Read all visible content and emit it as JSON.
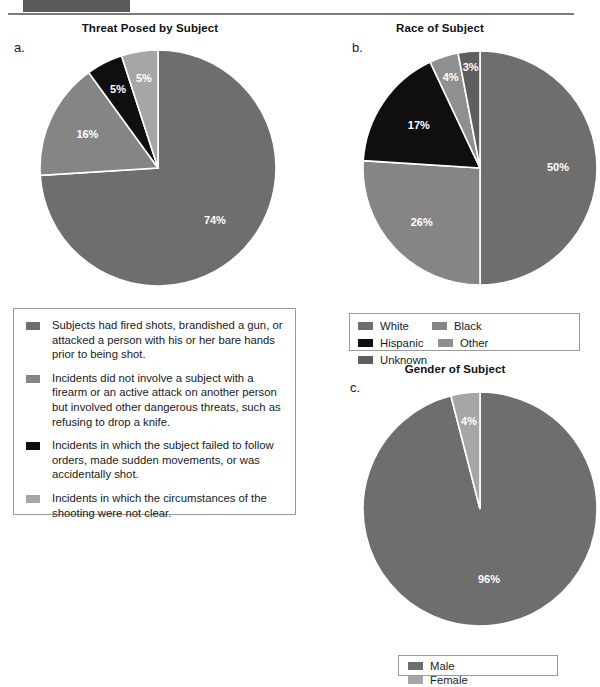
{
  "page": {
    "header_bar_color": "#595959",
    "header_rule_color": "#7a7a7a"
  },
  "palette": {
    "dark_gray": "#6e6e6e",
    "medium_gray": "#858585",
    "light_gray": "#a6a6a6",
    "black": "#0f0f0f",
    "mid_dark_gray": "#5e5e5e",
    "slice_divider": "#ffffff",
    "label_text": "#ffffff",
    "legend_border": "#9a9a9a"
  },
  "charts": [
    {
      "letter": "a.",
      "title": "Threat Posed by Subject",
      "chart_data": {
        "type": "pie",
        "title": "Threat Posed by Subject",
        "categories": [
          "Subjects had fired shots, brandished a gun, or attacked a person with his or her bare hands prior to being shot.",
          "Incidents did not involve a subject with a firearm or an active attack on another person but involved other dangerous threats, such as refusing to drop a knife.",
          "Incidents in which the subject failed to follow orders, made sudden movements, or was accidentally shot.",
          "Incidents in which the circumstances of the shooting were not clear."
        ],
        "values": [
          74,
          16,
          5,
          5
        ],
        "labels": [
          "74%",
          "16%",
          "5%",
          "5%"
        ],
        "colors": [
          "#6e6e6e",
          "#858585",
          "#0f0f0f",
          "#a6a6a6"
        ],
        "start_angle": 0,
        "direction": "clockwise",
        "legend_position": "below"
      }
    },
    {
      "letter": "b.",
      "title": "Race of Subject",
      "chart_data": {
        "type": "pie",
        "title": "Race of Subject",
        "categories": [
          "White",
          "Black",
          "Hispanic",
          "Other",
          "Unknown"
        ],
        "values": [
          50,
          26,
          17,
          4,
          3
        ],
        "labels": [
          "50%",
          "26%",
          "17%",
          "4%",
          "3%"
        ],
        "colors": [
          "#6e6e6e",
          "#858585",
          "#0f0f0f",
          "#8f8f8f",
          "#5e5e5e"
        ],
        "start_angle": 0,
        "direction": "clockwise",
        "legend_position": "below"
      }
    },
    {
      "letter": "c.",
      "title": "Gender of Subject",
      "chart_data": {
        "type": "pie",
        "title": "Gender of Subject",
        "categories": [
          "Male",
          "Female"
        ],
        "values": [
          96,
          4
        ],
        "labels": [
          "96%",
          "4%"
        ],
        "colors": [
          "#6e6e6e",
          "#a6a6a6"
        ],
        "start_angle": 0,
        "direction": "clockwise",
        "legend_position": "below"
      }
    }
  ],
  "legend_threat": {
    "items": [
      {
        "color": "#6e6e6e",
        "text": "Subjects had fired shots, brandished a gun, or attacked a person with his or her bare hands prior to being shot."
      },
      {
        "color": "#858585",
        "text": "Incidents did not involve a subject with a firearm or an active attack on another person but involved other dangerous threats, such as refusing to drop a knife."
      },
      {
        "color": "#0f0f0f",
        "text": "Incidents in which the subject failed to follow orders, made sudden movements, or was accidentally shot."
      },
      {
        "color": "#a6a6a6",
        "text": "Incidents in which the circumstances of the shooting were not clear."
      }
    ]
  },
  "legend_race": {
    "items": [
      {
        "label": "White",
        "color": "#6e6e6e"
      },
      {
        "label": "Black",
        "color": "#858585"
      },
      {
        "label": "Hispanic",
        "color": "#0f0f0f"
      },
      {
        "label": "Other",
        "color": "#8f8f8f"
      },
      {
        "label": "Unknown",
        "color": "#5e5e5e"
      }
    ]
  },
  "legend_gender": {
    "items": [
      {
        "label": "Male",
        "color": "#6e6e6e"
      },
      {
        "label": "Female",
        "color": "#a6a6a6"
      }
    ]
  }
}
